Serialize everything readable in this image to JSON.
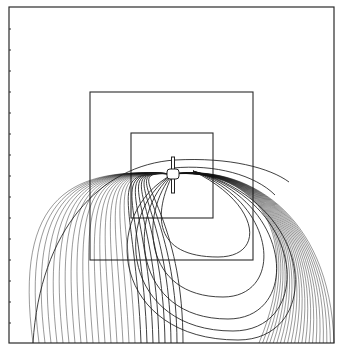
{
  "figure": {
    "type": "trajectory-plot",
    "frame": {
      "x": 9,
      "y": 7,
      "w": 325,
      "h": 336
    },
    "left_ticks_y": [
      29,
      50,
      71,
      92,
      113,
      134,
      155,
      176,
      197,
      218,
      239,
      260,
      281,
      302,
      323
    ],
    "boxes": [
      {
        "name": "middle-box",
        "x": 90,
        "y": 92,
        "w": 163,
        "h": 168
      },
      {
        "name": "inner-box",
        "x": 131,
        "y": 133,
        "w": 82,
        "h": 85
      }
    ],
    "object": {
      "cx": 173,
      "cy": 174,
      "rod_top": 157,
      "rod_bottom": 193
    },
    "colors": {
      "line": "#1e1e1e",
      "background": "#ffffff"
    }
  }
}
